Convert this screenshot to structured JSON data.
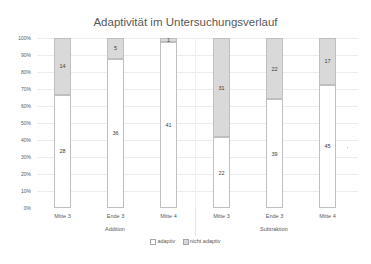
{
  "chart_data": {
    "type": "bar",
    "stacked": "percent",
    "title": "Adaptivität im Untersuchungsverlauf",
    "xlabel": "",
    "ylabel": "",
    "ylim": [
      0,
      100
    ],
    "yticks": [
      "0%",
      "10%",
      "20%",
      "30%",
      "40%",
      "50%",
      "60%",
      "70%",
      "80%",
      "90%",
      "100%"
    ],
    "categories": [
      "Mitte 3",
      "Ende 3",
      "Mitte 4",
      "Mitte 3",
      "Ende 3",
      "Mitte 4"
    ],
    "groups": [
      {
        "label": "Addition",
        "categories": [
          "Mitte 3",
          "Ende 3",
          "Mitte 4"
        ]
      },
      {
        "label": "Subtraktion",
        "categories": [
          "Mitte 3",
          "Ende 3",
          "Mitte 4"
        ]
      }
    ],
    "series": [
      {
        "name": "adaptiv",
        "color": "#ffffff",
        "values": [
          28,
          36,
          41,
          22,
          39,
          45
        ]
      },
      {
        "name": "nicht adaptiv",
        "color": "#d9d9d9",
        "values": [
          14,
          5,
          1,
          31,
          22,
          17
        ]
      }
    ],
    "grid": true,
    "legend_position": "bottom"
  },
  "labels": {
    "title": "Adaptivität im Untersuchungsverlauf",
    "group_addition": "Addition",
    "group_subtraktion": "Subtraktion",
    "legend_adaptiv": "adaptiv",
    "legend_nicht_adaptiv": "nicht adaptiv"
  }
}
